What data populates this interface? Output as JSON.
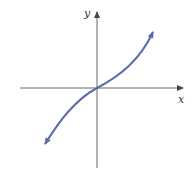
{
  "figure": {
    "x_axis_label": "x",
    "y_axis_label": "y",
    "curve_description": "increasing odd function passing through origin (cubic-like / sinh-like), arrows at both ends",
    "colors": {
      "axes": "#555555",
      "curve": "#5b6aa8",
      "background": "#ffffff"
    }
  }
}
